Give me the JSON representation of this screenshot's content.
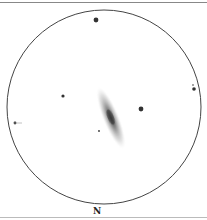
{
  "sketch": {
    "orientation_label": "N",
    "field_circle": {
      "cx": 104,
      "cy": 107,
      "r": 97,
      "stroke": "#444444"
    },
    "galaxy": {
      "cx": 111,
      "cy": 118,
      "rx": 7,
      "ry": 32,
      "rotate": -22,
      "core_color": "#333333"
    },
    "stars": [
      {
        "name": "star-top",
        "cx": 96,
        "cy": 20,
        "r": 2.4
      },
      {
        "name": "star-left",
        "cx": 63,
        "cy": 96,
        "r": 1.6
      },
      {
        "name": "star-right",
        "cx": 141,
        "cy": 109,
        "r": 2.4
      },
      {
        "name": "star-far-right",
        "cx": 194,
        "cy": 89,
        "r": 1.8
      },
      {
        "name": "star-far-right-faint",
        "cx": 193,
        "cy": 85,
        "r": 0.8
      },
      {
        "name": "star-near-galaxy",
        "cx": 99,
        "cy": 131,
        "r": 0.9
      },
      {
        "name": "star-left-edge",
        "cx": 15,
        "cy": 123,
        "r": 1.4
      }
    ]
  }
}
